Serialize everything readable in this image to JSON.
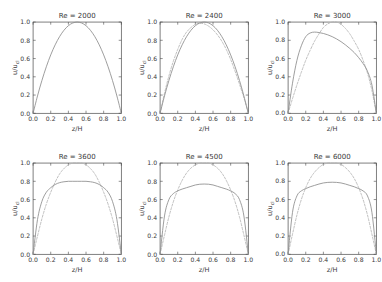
{
  "figure": {
    "layout": "2x3 grid of subplots",
    "background_color": "#ffffff",
    "solid_curve_color": "#8d8d8d",
    "dashed_curve_color": "#b4b4b4",
    "axis_color": "#4a4a4a"
  },
  "axes": {
    "xlabel": "z/H",
    "ylabel": "u/u_cl",
    "xticks": [
      "0.0",
      "0.2",
      "0.4",
      "0.6",
      "0.8",
      "1.0"
    ],
    "yticks": [
      "0.0",
      "0.2",
      "0.4",
      "0.6",
      "0.8",
      "1.0"
    ],
    "xlim": [
      0.0,
      1.0
    ],
    "ylim": [
      0.0,
      1.0
    ]
  },
  "panels": [
    {
      "title": "Re = 2000"
    },
    {
      "title": "Re = 2400"
    },
    {
      "title": "Re = 3000"
    },
    {
      "title": "Re = 3600"
    },
    {
      "title": "Re = 4500"
    },
    {
      "title": "Re = 6000"
    }
  ],
  "chart_data": {
    "type": "line",
    "xlabel": "z/H",
    "ylabel": "u/u_cl",
    "xlim": [
      0.0,
      1.0
    ],
    "ylim": [
      0.0,
      1.0
    ],
    "xticks": [
      0.0,
      0.2,
      0.4,
      0.6,
      0.8,
      1.0
    ],
    "yticks": [
      0.0,
      0.2,
      0.4,
      0.6,
      0.8,
      1.0
    ],
    "grid": false,
    "legend": "none",
    "subplots": [
      {
        "title": "Re = 2000",
        "reynolds_number": 2000,
        "x": [
          0.0,
          0.05,
          0.1,
          0.15,
          0.2,
          0.25,
          0.3,
          0.35,
          0.4,
          0.45,
          0.5,
          0.55,
          0.6,
          0.65,
          0.7,
          0.75,
          0.8,
          0.85,
          0.9,
          0.95,
          1.0
        ],
        "series": [
          {
            "name": "solid",
            "style": "solid",
            "peak_x": 0.5,
            "peak_y": 1.0,
            "values": [
              0.0,
              0.19,
              0.36,
              0.51,
              0.64,
              0.75,
              0.84,
              0.91,
              0.96,
              0.99,
              1.0,
              0.99,
              0.96,
              0.91,
              0.84,
              0.75,
              0.64,
              0.51,
              0.36,
              0.19,
              0.0
            ]
          }
        ]
      },
      {
        "title": "Re = 2400",
        "reynolds_number": 2400,
        "x": [
          0.0,
          0.05,
          0.1,
          0.15,
          0.2,
          0.25,
          0.3,
          0.35,
          0.4,
          0.45,
          0.5,
          0.55,
          0.6,
          0.65,
          0.7,
          0.75,
          0.8,
          0.85,
          0.9,
          0.95,
          1.0
        ],
        "series": [
          {
            "name": "solid",
            "style": "solid",
            "peak_x": 0.5,
            "peak_y": 1.0,
            "values": [
              0.0,
              0.19,
              0.36,
              0.51,
              0.64,
              0.75,
              0.84,
              0.91,
              0.96,
              0.99,
              1.0,
              0.99,
              0.96,
              0.91,
              0.84,
              0.75,
              0.64,
              0.51,
              0.36,
              0.19,
              0.0
            ]
          },
          {
            "name": "dashed",
            "style": "dashed",
            "peak_x": 0.44,
            "peak_y": 0.985,
            "values": [
              0.0,
              0.22,
              0.41,
              0.57,
              0.7,
              0.81,
              0.89,
              0.94,
              0.975,
              0.985,
              0.98,
              0.955,
              0.915,
              0.86,
              0.79,
              0.7,
              0.59,
              0.46,
              0.32,
              0.17,
              0.0
            ]
          }
        ]
      },
      {
        "title": "Re = 3000",
        "reynolds_number": 3000,
        "x": [
          0.0,
          0.05,
          0.1,
          0.15,
          0.2,
          0.25,
          0.3,
          0.35,
          0.4,
          0.45,
          0.5,
          0.55,
          0.6,
          0.65,
          0.7,
          0.75,
          0.8,
          0.85,
          0.9,
          0.95,
          1.0
        ],
        "series": [
          {
            "name": "solid",
            "style": "solid",
            "peak_x": 0.28,
            "peak_y": 0.89,
            "values": [
              0.0,
              0.33,
              0.58,
              0.74,
              0.84,
              0.88,
              0.89,
              0.885,
              0.875,
              0.86,
              0.84,
              0.815,
              0.785,
              0.75,
              0.71,
              0.665,
              0.61,
              0.545,
              0.46,
              0.31,
              0.0
            ]
          },
          {
            "name": "dashed",
            "style": "dashed",
            "peak_x": 0.53,
            "peak_y": 1.0,
            "values": [
              0.0,
              0.16,
              0.31,
              0.45,
              0.58,
              0.69,
              0.79,
              0.87,
              0.94,
              0.98,
              1.0,
              1.0,
              0.975,
              0.93,
              0.87,
              0.79,
              0.7,
              0.58,
              0.44,
              0.25,
              0.0
            ]
          }
        ]
      },
      {
        "title": "Re = 3600",
        "reynolds_number": 3600,
        "x": [
          0.0,
          0.05,
          0.1,
          0.15,
          0.2,
          0.25,
          0.3,
          0.35,
          0.4,
          0.45,
          0.5,
          0.55,
          0.6,
          0.65,
          0.7,
          0.75,
          0.8,
          0.85,
          0.9,
          0.95,
          1.0
        ],
        "series": [
          {
            "name": "solid",
            "style": "solid",
            "peak_x": 0.5,
            "peak_y": 0.8,
            "values": [
              0.0,
              0.38,
              0.58,
              0.68,
              0.73,
              0.765,
              0.785,
              0.795,
              0.8,
              0.8,
              0.8,
              0.8,
              0.8,
              0.795,
              0.785,
              0.765,
              0.73,
              0.68,
              0.58,
              0.38,
              0.0
            ]
          },
          {
            "name": "dashed",
            "style": "dashed",
            "peak_x": 0.5,
            "peak_y": 1.0,
            "values": [
              0.0,
              0.2,
              0.39,
              0.55,
              0.68,
              0.79,
              0.88,
              0.94,
              0.98,
              1.0,
              1.0,
              1.0,
              0.98,
              0.94,
              0.88,
              0.79,
              0.68,
              0.55,
              0.39,
              0.2,
              0.0
            ]
          }
        ]
      },
      {
        "title": "Re = 4500",
        "reynolds_number": 4500,
        "x": [
          0.0,
          0.05,
          0.1,
          0.15,
          0.2,
          0.25,
          0.3,
          0.35,
          0.4,
          0.45,
          0.5,
          0.55,
          0.6,
          0.65,
          0.7,
          0.75,
          0.8,
          0.85,
          0.9,
          0.95,
          1.0
        ],
        "series": [
          {
            "name": "solid",
            "style": "solid",
            "peak_x": 0.5,
            "peak_y": 0.77,
            "values": [
              0.0,
              0.42,
              0.6,
              0.665,
              0.695,
              0.715,
              0.73,
              0.745,
              0.76,
              0.768,
              0.77,
              0.768,
              0.76,
              0.745,
              0.73,
              0.715,
              0.695,
              0.665,
              0.6,
              0.42,
              0.0
            ]
          },
          {
            "name": "dashed",
            "style": "dashed",
            "peak_x": 0.5,
            "peak_y": 1.0,
            "values": [
              0.0,
              0.21,
              0.41,
              0.575,
              0.705,
              0.81,
              0.89,
              0.945,
              0.98,
              1.0,
              1.0,
              1.0,
              0.98,
              0.945,
              0.89,
              0.81,
              0.705,
              0.575,
              0.41,
              0.21,
              0.0
            ]
          }
        ]
      },
      {
        "title": "Re = 6000",
        "reynolds_number": 6000,
        "x": [
          0.0,
          0.05,
          0.1,
          0.15,
          0.2,
          0.25,
          0.3,
          0.35,
          0.4,
          0.45,
          0.5,
          0.55,
          0.6,
          0.65,
          0.7,
          0.75,
          0.8,
          0.85,
          0.9,
          0.95,
          1.0
        ],
        "series": [
          {
            "name": "solid",
            "style": "solid",
            "peak_x": 0.5,
            "peak_y": 0.79,
            "values": [
              0.0,
              0.46,
              0.64,
              0.695,
              0.72,
              0.74,
              0.755,
              0.77,
              0.782,
              0.788,
              0.79,
              0.788,
              0.782,
              0.77,
              0.755,
              0.74,
              0.72,
              0.695,
              0.64,
              0.46,
              0.0
            ]
          },
          {
            "name": "dashed",
            "style": "dashed",
            "peak_x": 0.5,
            "peak_y": 1.0,
            "values": [
              0.0,
              0.22,
              0.43,
              0.6,
              0.73,
              0.83,
              0.9,
              0.95,
              0.985,
              1.0,
              1.0,
              1.0,
              0.985,
              0.95,
              0.9,
              0.83,
              0.73,
              0.6,
              0.43,
              0.22,
              0.0
            ]
          }
        ]
      }
    ]
  }
}
